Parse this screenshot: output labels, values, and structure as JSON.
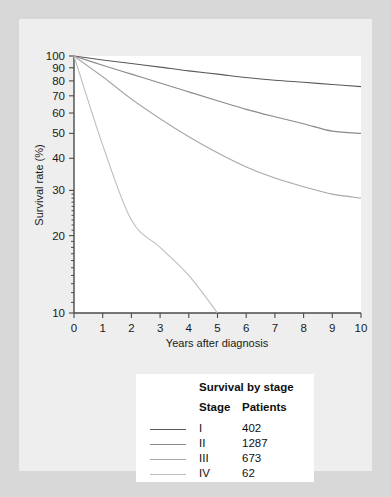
{
  "chart_data": {
    "type": "line",
    "title": "",
    "xlabel": "Years after diagnosis",
    "ylabel": "Survival rate (%)",
    "yscale": "log",
    "xlim": [
      0,
      10
    ],
    "ylim": [
      10,
      100
    ],
    "grid": false,
    "legend_position": "below-chart",
    "x_ticks": [
      "0",
      "1",
      "2",
      "3",
      "4",
      "5",
      "6",
      "7",
      "8",
      "9",
      "10"
    ],
    "y_ticks": [
      "100",
      "90",
      "80",
      "70",
      "60",
      "50",
      "40",
      "30",
      "20",
      "10"
    ],
    "x": [
      0,
      1,
      2,
      3,
      4,
      5,
      6,
      7,
      8,
      9,
      10
    ],
    "series": [
      {
        "name": "I",
        "patients": "402",
        "color": "#595959",
        "values": [
          100,
          96.5,
          93.5,
          90.5,
          87.5,
          85,
          82.5,
          80.5,
          79,
          77.5,
          76
        ]
      },
      {
        "name": "II",
        "patients": "1287",
        "color": "#8a8a8a",
        "values": [
          100,
          92,
          85,
          78.5,
          72.5,
          67,
          62,
          58,
          54.5,
          51,
          50
        ]
      },
      {
        "name": "III",
        "patients": "673",
        "color": "#a8a8a8",
        "values": [
          100,
          83,
          68,
          57,
          48.5,
          42,
          37,
          33.5,
          31,
          29,
          28
        ]
      },
      {
        "name": "IV",
        "patients": "62",
        "color": "#bdbdbd",
        "values": [
          100,
          45,
          23,
          18,
          14,
          10,
          null,
          null,
          null,
          null,
          null
        ]
      }
    ]
  },
  "legend": {
    "title": "Survival by stage",
    "columns": [
      "Stage",
      "Patients"
    ],
    "rows": [
      {
        "stage": "I",
        "patients": "402",
        "color": "#595959"
      },
      {
        "stage": "II",
        "patients": "1287",
        "color": "#8a8a8a"
      },
      {
        "stage": "III",
        "patients": "673",
        "color": "#a8a8a8"
      },
      {
        "stage": "IV",
        "patients": "62",
        "color": "#bdbdbd"
      }
    ]
  }
}
